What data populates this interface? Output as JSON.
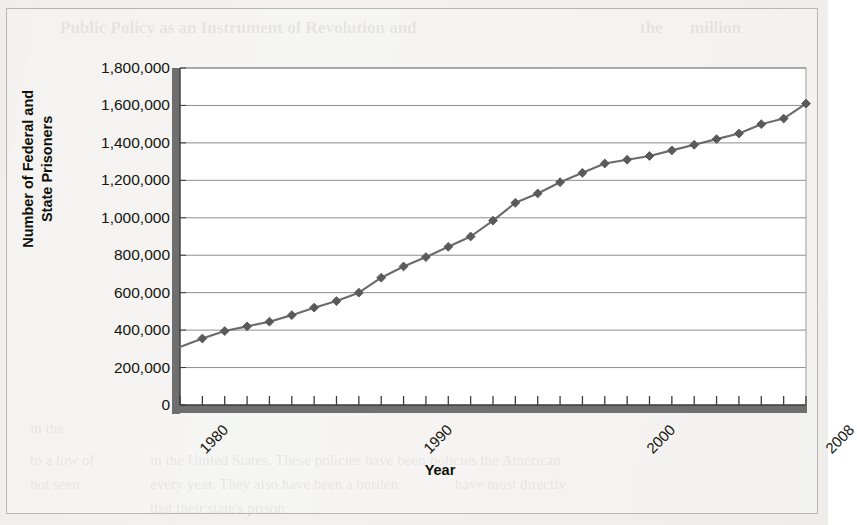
{
  "figure": {
    "background_color": "#f2f1ef",
    "frame_color": "#b9b7b4",
    "plot_background": "#ffffff"
  },
  "bleed_through_text": [
    {
      "text": "Public Policy as an Instrument of Revolution and",
      "x": 60,
      "y": 18,
      "size": 17,
      "bold": true
    },
    {
      "text": "the",
      "x": 640,
      "y": 18,
      "size": 17,
      "bold": true
    },
    {
      "text": "million",
      "x": 690,
      "y": 18,
      "size": 17,
      "bold": true
    },
    {
      "text": "in the",
      "x": 30,
      "y": 420,
      "size": 15,
      "bold": false
    },
    {
      "text": "to a low of",
      "x": 30,
      "y": 452,
      "size": 15,
      "bold": false
    },
    {
      "text": "not seen",
      "x": 30,
      "y": 476,
      "size": 15,
      "bold": false
    },
    {
      "text": "policies the American",
      "x": 430,
      "y": 452,
      "size": 15,
      "bold": false
    },
    {
      "text": "have most directly",
      "x": 455,
      "y": 476,
      "size": 15,
      "bold": false
    },
    {
      "text": "in the United States. These policies have been",
      "x": 150,
      "y": 452,
      "size": 15,
      "bold": false
    },
    {
      "text": "every year. They also have been a burden",
      "x": 150,
      "y": 476,
      "size": 15,
      "bold": false
    },
    {
      "text": "that their state's prison",
      "x": 150,
      "y": 500,
      "size": 15,
      "bold": false
    }
  ],
  "chart_data": {
    "type": "line",
    "title": "",
    "xlabel": "Year",
    "ylabel": "Number of Federal and\nState Prisoners",
    "ylabel_lines": [
      "Number of Federal and",
      "State Prisoners"
    ],
    "grid": true,
    "legend": false,
    "ylim": [
      0,
      1800000
    ],
    "ytick_step": 200000,
    "ytick_labels": [
      "1,800,000",
      "1,600,000",
      "1,400,000",
      "1,200,000",
      "1,000,000",
      "800,000",
      "600,000",
      "400,000",
      "200,000",
      "0"
    ],
    "ytick_values": [
      1800000,
      1600000,
      1400000,
      1200000,
      1000000,
      800000,
      600000,
      400000,
      200000,
      0
    ],
    "xlim": [
      1980,
      2008
    ],
    "xtick_labels_shown": [
      "1980",
      "1990",
      "2000",
      "2008"
    ],
    "xtick_label_rotation": -45,
    "series_name": "Number of Federal and State Prisoners",
    "line_color": "#6b6b6b",
    "marker_color": "#5a5a5a",
    "marker": "diamond",
    "x": [
      1980,
      1981,
      1982,
      1983,
      1984,
      1985,
      1986,
      1987,
      1988,
      1989,
      1990,
      1991,
      1992,
      1993,
      1994,
      1995,
      1996,
      1997,
      1998,
      1999,
      2000,
      2001,
      2002,
      2003,
      2004,
      2005,
      2006,
      2007,
      2008
    ],
    "values": [
      310000,
      355000,
      395000,
      420000,
      445000,
      480000,
      520000,
      555000,
      600000,
      680000,
      740000,
      790000,
      845000,
      900000,
      985000,
      1080000,
      1130000,
      1190000,
      1240000,
      1290000,
      1310000,
      1330000,
      1360000,
      1390000,
      1420000,
      1450000,
      1500000,
      1530000,
      1610000
    ]
  }
}
